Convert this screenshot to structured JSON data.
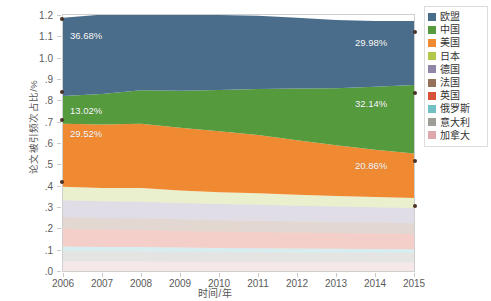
{
  "axes": {
    "y_label": "论文被引频次占比/%",
    "x_label": "时间/年",
    "y_ticks": [
      "1.2",
      "1.1",
      "1.0",
      ".9",
      ".8",
      ".7",
      ".6",
      ".5",
      ".4",
      ".3",
      ".2",
      ".1",
      ".0"
    ],
    "x_ticks": [
      "2006",
      "2007",
      "2008",
      "2009",
      "2010",
      "2011",
      "2012",
      "2013",
      "2014",
      "2015"
    ]
  },
  "legend": {
    "items": [
      {
        "label": "欧盟",
        "color": "#4a6d8c"
      },
      {
        "label": "中国",
        "color": "#559b3e"
      },
      {
        "label": "美国",
        "color": "#f08a32"
      },
      {
        "label": "日本",
        "color": "#b8c martial"
      },
      {
        "label": "德国",
        "color": "#8f86a8"
      },
      {
        "label": "法国",
        "color": "#96715a"
      },
      {
        "label": "英国",
        "color": "#d9533c"
      },
      {
        "label": "俄罗斯",
        "color": "#70c0c4"
      },
      {
        "label": "意大利",
        "color": "#9e9e96"
      },
      {
        "label": "加拿大",
        "color": "#dda9ac"
      }
    ]
  },
  "annotations": [
    {
      "name": "eu-start-label",
      "text": "36.68%",
      "x": 70,
      "y": 30
    },
    {
      "name": "eu-end-label",
      "text": "29.98%",
      "x": 355,
      "y": 37
    },
    {
      "name": "china-start-label",
      "text": "13.02%",
      "x": 70,
      "y": 105
    },
    {
      "name": "china-end-label",
      "text": "32.14%",
      "x": 355,
      "y": 98
    },
    {
      "name": "usa-start-label",
      "text": "29.52%",
      "x": 70,
      "y": 128
    },
    {
      "name": "usa-end-label",
      "text": "20.86%",
      "x": 355,
      "y": 160
    }
  ],
  "markers": [
    {
      "x": 62,
      "y": 19
    },
    {
      "x": 415,
      "y": 32
    },
    {
      "x": 62,
      "y": 92
    },
    {
      "x": 415,
      "y": 93
    },
    {
      "x": 62,
      "y": 120
    },
    {
      "x": 415,
      "y": 161
    },
    {
      "x": 62,
      "y": 182
    },
    {
      "x": 415,
      "y": 206
    }
  ],
  "chart_data": {
    "type": "area",
    "stacked": true,
    "title": "",
    "xlabel": "时间/年",
    "ylabel": "论文被引频次占比/%",
    "xlim": [
      2006,
      2015
    ],
    "ylim": [
      0,
      1.2
    ],
    "grid": false,
    "legend_position": "right",
    "x": [
      2006,
      2007,
      2008,
      2009,
      2010,
      2011,
      2012,
      2013,
      2014,
      2015
    ],
    "series": [
      {
        "name": "加拿大",
        "color": "#dda9ac",
        "values": [
          0.045,
          0.044,
          0.044,
          0.043,
          0.042,
          0.042,
          0.041,
          0.041,
          0.04,
          0.04
        ]
      },
      {
        "name": "意大利",
        "color": "#9e9e96",
        "values": [
          0.048,
          0.048,
          0.047,
          0.047,
          0.046,
          0.046,
          0.045,
          0.045,
          0.045,
          0.044
        ]
      },
      {
        "name": "俄罗斯",
        "color": "#70c0c4",
        "values": [
          0.022,
          0.021,
          0.021,
          0.02,
          0.02,
          0.019,
          0.019,
          0.018,
          0.018,
          0.018
        ]
      },
      {
        "name": "英国",
        "color": "#d9533c",
        "values": [
          0.082,
          0.081,
          0.08,
          0.078,
          0.077,
          0.076,
          0.075,
          0.074,
          0.073,
          0.072
        ]
      },
      {
        "name": "法国",
        "color": "#96715a",
        "values": [
          0.056,
          0.055,
          0.055,
          0.054,
          0.053,
          0.053,
          0.052,
          0.051,
          0.051,
          0.05
        ]
      },
      {
        "name": "德国",
        "color": "#8f86a8",
        "values": [
          0.079,
          0.078,
          0.078,
          0.077,
          0.076,
          0.075,
          0.074,
          0.073,
          0.072,
          0.071
        ]
      },
      {
        "name": "日本",
        "color": "#b5c44a",
        "values": [
          0.063,
          0.062,
          0.064,
          0.058,
          0.055,
          0.053,
          0.051,
          0.049,
          0.048,
          0.047
        ]
      },
      {
        "name": "美国",
        "color": "#f08a32",
        "values": [
          0.2952,
          0.298,
          0.301,
          0.294,
          0.286,
          0.274,
          0.256,
          0.238,
          0.221,
          0.2086
        ]
      },
      {
        "name": "中国",
        "color": "#559b3e",
        "values": [
          0.1302,
          0.143,
          0.157,
          0.174,
          0.193,
          0.215,
          0.242,
          0.268,
          0.296,
          0.3214
        ]
      },
      {
        "name": "欧盟",
        "color": "#4a6d8c",
        "values": [
          0.3668,
          0.372,
          0.379,
          0.361,
          0.352,
          0.343,
          0.332,
          0.32,
          0.308,
          0.2998
        ]
      }
    ],
    "labeled_points": [
      {
        "series": "欧盟",
        "x": 2006,
        "value": "36.68%"
      },
      {
        "series": "欧盟",
        "x": 2015,
        "value": "29.98%"
      },
      {
        "series": "中国",
        "x": 2006,
        "value": "13.02%"
      },
      {
        "series": "中国",
        "x": 2015,
        "value": "32.14%"
      },
      {
        "series": "美国",
        "x": 2006,
        "value": "29.52%"
      },
      {
        "series": "美国",
        "x": 2015,
        "value": "20.86%"
      }
    ]
  }
}
